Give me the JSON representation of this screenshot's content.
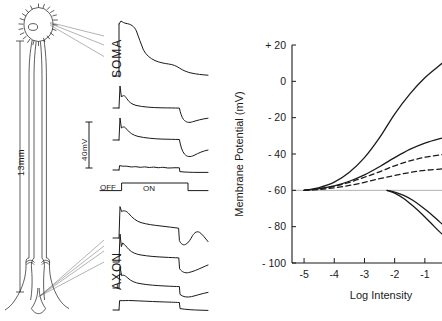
{
  "figure": {
    "kind": "neurophysiology-figure",
    "panels": [
      "neuron-diagram-and-traces",
      "intensity-response-plot"
    ]
  },
  "diagram": {
    "scale_label": "13mm",
    "soma_label": "SOMA",
    "axon_label": "AXON",
    "voltage_scale_label": "40mV",
    "stimulus_off_label": "OFF",
    "stimulus_on_label": "ON",
    "soma_trace_count": 4,
    "axon_trace_count": 4
  },
  "chart_data": {
    "type": "line",
    "title": "",
    "xlabel": "Log Intensity",
    "ylabel": "Membrane Potential (mV)",
    "xlim": [
      -5.4,
      -0.2
    ],
    "ylim": [
      -100,
      20
    ],
    "xticks": [
      -5,
      -4,
      -3,
      -2,
      -1
    ],
    "xticklabels": [
      "-5",
      "-4",
      "-3",
      "-2",
      "-1"
    ],
    "yticks": [
      20,
      0,
      -20,
      -40,
      -60,
      -80,
      -100
    ],
    "yticklabels": [
      "+ 20",
      "0",
      "- 20",
      "- 40",
      "- 60",
      "- 80",
      "- 100"
    ],
    "grid": false,
    "legend": "none",
    "reference_line_y": -60,
    "resting_potential": -60,
    "series": [
      {
        "name": "soma-depolarizing-large",
        "style": "solid",
        "x": [
          -5,
          -4.5,
          -4,
          -3.5,
          -3,
          -2.5,
          -2,
          -1.5,
          -1,
          -0.5,
          -0.2
        ],
        "y": [
          -60,
          -58.5,
          -55.5,
          -50,
          -42,
          -31,
          -18,
          -7,
          2,
          9,
          13
        ]
      },
      {
        "name": "soma-depolarizing-medium",
        "style": "solid",
        "x": [
          -5,
          -4.5,
          -4,
          -3.5,
          -3,
          -2.5,
          -2,
          -1.5,
          -1,
          -0.5,
          -0.2
        ],
        "y": [
          -60,
          -59,
          -57.5,
          -55,
          -51.5,
          -47,
          -42,
          -37.5,
          -34,
          -31.5,
          -30.5
        ]
      },
      {
        "name": "axon-depolarizing-dashed-upper",
        "style": "dashed",
        "x": [
          -5,
          -4.5,
          -4,
          -3.5,
          -3,
          -2.5,
          -2,
          -1.5,
          -1,
          -0.5,
          -0.2
        ],
        "y": [
          -60,
          -59.2,
          -57.8,
          -55.6,
          -52.8,
          -49.8,
          -46.5,
          -43.8,
          -41.8,
          -40.5,
          -40
        ]
      },
      {
        "name": "axon-depolarizing-dashed-lower",
        "style": "dashed",
        "x": [
          -5,
          -4.5,
          -4,
          -3.5,
          -3,
          -2.5,
          -2,
          -1.5,
          -1,
          -0.5,
          -0.2
        ],
        "y": [
          -60,
          -59.5,
          -58.6,
          -57.3,
          -55.6,
          -53.6,
          -51.8,
          -50.2,
          -49,
          -48.3,
          -48
        ]
      },
      {
        "name": "hyperpolarizing-outer",
        "style": "solid",
        "x": [
          -2.25,
          -2,
          -1.7,
          -1.4,
          -1.1,
          -0.8,
          -0.5,
          -0.2
        ],
        "y": [
          -60,
          -61.5,
          -64.5,
          -68.5,
          -73,
          -78,
          -83,
          -87
        ]
      },
      {
        "name": "hyperpolarizing-inner",
        "style": "solid",
        "x": [
          -2.25,
          -2,
          -1.7,
          -1.4,
          -1.1,
          -0.8,
          -0.5,
          -0.2
        ],
        "y": [
          -60,
          -61,
          -62.8,
          -65.5,
          -69,
          -73,
          -77.5,
          -81.5
        ]
      }
    ]
  },
  "colors": {
    "ink": "#1a1a1a",
    "hairline": "#555555",
    "reference": "#9a9a9a",
    "background": "#ffffff"
  }
}
